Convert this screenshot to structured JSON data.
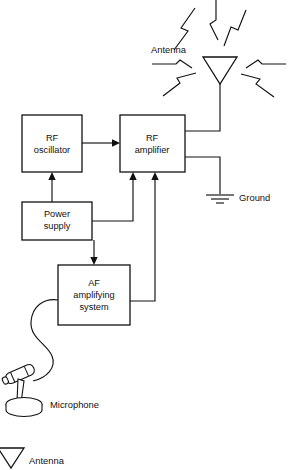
{
  "diagram": {
    "blocks": [
      {
        "id": "rf_oscillator",
        "line1": "RF",
        "line2": "oscillator"
      },
      {
        "id": "rf_amplifier",
        "line1": "RF",
        "line2": "amplifier"
      },
      {
        "id": "power_supply",
        "line1": "Power",
        "line2": "supply"
      },
      {
        "id": "af_amplifying_system",
        "line1": "AF",
        "line2": "amplifying",
        "line3": "system"
      }
    ],
    "labels": {
      "antenna": "Antenna",
      "ground": "Ground",
      "microphone": "Microphone",
      "legend_antenna": "Antenna"
    },
    "colors": {
      "ink": "#111111",
      "paper": "#ffffff"
    }
  }
}
